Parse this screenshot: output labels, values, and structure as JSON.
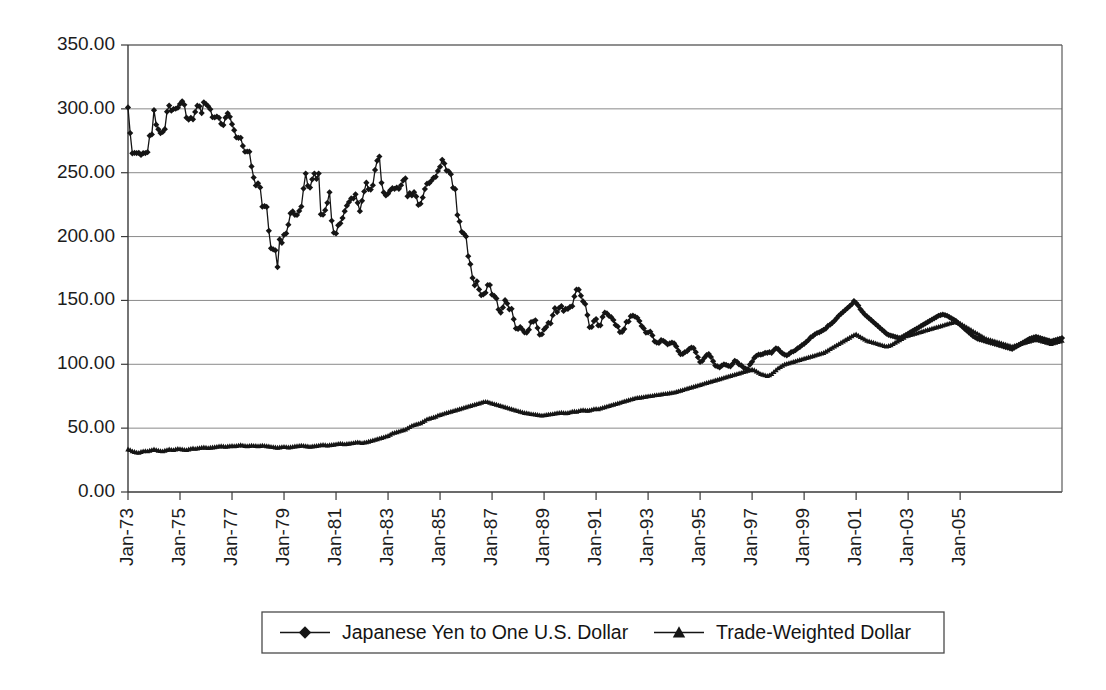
{
  "chart_data": {
    "type": "line",
    "title": "",
    "subtitle": "",
    "xlabel": "",
    "ylabel": "",
    "ylim": [
      0,
      350
    ],
    "ytick_step": 50,
    "ytick_labels": [
      "0.00",
      "50.00",
      "100.00",
      "150.00",
      "200.00",
      "250.00",
      "300.00",
      "350.00"
    ],
    "ytick_values": [
      0,
      50,
      100,
      150,
      200,
      250,
      300,
      350
    ],
    "xtick_labels": [
      "Jan-73",
      "Jan-75",
      "Jan-77",
      "Jan-79",
      "Jan-81",
      "Jan-83",
      "Jan-85",
      "Jan-87",
      "Jan-89",
      "Jan-91",
      "Jan-93",
      "Jan-95",
      "Jan-97",
      "Jan-99",
      "Jan-01",
      "Jan-03",
      "Jan-05"
    ],
    "xtick_rotation": -90,
    "x_start_label": "Jan-73",
    "x_end_label": "Dec-06",
    "x_points_per_tick": 24,
    "grid": "horizontal",
    "legend_position": "bottom",
    "colors": {
      "series": "#151515",
      "grid": "#8a8a8a",
      "axis": "#3a3a3a",
      "background": "#ffffff"
    },
    "series": [
      {
        "name": "Japanese Yen to One U.S. Dollar",
        "marker": "diamond",
        "values": [
          301.1,
          281.0,
          265.2,
          265.5,
          265.4,
          265.6,
          263.9,
          265.4,
          265.4,
          266.1,
          279.0,
          280.0,
          299.0,
          287.6,
          284.0,
          281.0,
          281.9,
          284.1,
          297.8,
          302.6,
          298.5,
          299.9,
          300.1,
          300.9,
          303.8,
          305.9,
          303.2,
          293.1,
          291.6,
          293.0,
          291.8,
          297.6,
          302.5,
          302.0,
          296.7,
          305.1,
          303.7,
          302.0,
          299.7,
          293.5,
          293.3,
          294.0,
          293.0,
          288.3,
          287.3,
          293.1,
          296.5,
          293.8,
          288.0,
          283.3,
          277.7,
          277.3,
          277.3,
          271.0,
          266.4,
          266.6,
          266.5,
          254.9,
          246.2,
          240.0,
          241.7,
          238.5,
          223.4,
          223.9,
          223.2,
          204.5,
          190.8,
          190.0,
          189.2,
          176.1,
          197.8,
          195.1,
          201.4,
          202.5,
          209.3,
          218.2,
          219.7,
          217.0,
          216.9,
          220.1,
          223.5,
          237.6,
          249.4,
          239.7,
          238.4,
          244.8,
          249.4,
          245.1,
          249.4,
          217.4,
          217.1,
          220.7,
          226.4,
          234.7,
          212.4,
          203.0,
          202.4,
          208.8,
          210.4,
          214.5,
          219.9,
          224.2,
          227.0,
          229.9,
          229.8,
          233.1,
          226.4,
          219.9,
          228.0,
          235.3,
          242.2,
          237.1,
          236.8,
          240.2,
          252.2,
          259.4,
          262.7,
          242.1,
          234.6,
          232.2,
          233.6,
          236.2,
          237.9,
          237.4,
          238.4,
          237.4,
          240.2,
          244.0,
          245.5,
          231.5,
          234.1,
          232.2,
          234.8,
          231.4,
          224.8,
          225.7,
          230.6,
          237.2,
          241.4,
          241.8,
          243.7,
          246.0,
          246.8,
          251.4,
          254.6,
          260.1,
          257.2,
          251.7,
          251.0,
          248.8,
          238.2,
          237.1,
          216.9,
          211.8,
          203.7,
          202.3,
          200.1,
          184.6,
          178.4,
          167.6,
          161.8,
          165.0,
          158.6,
          154.1,
          154.8,
          156.0,
          162.1,
          162.1,
          154.5,
          153.5,
          151.6,
          142.9,
          140.5,
          144.5,
          150.2,
          147.6,
          143.0,
          143.4,
          135.3,
          128.1,
          127.7,
          129.2,
          127.2,
          124.9,
          124.8,
          127.1,
          133.1,
          133.4,
          134.4,
          128.4,
          123.2,
          123.5,
          127.3,
          129.1,
          132.5,
          132.0,
          138.4,
          143.9,
          140.9,
          144.2,
          145.5,
          141.8,
          143.4,
          143.4,
          144.9,
          145.5,
          153.1,
          158.5,
          158.4,
          153.7,
          149.2,
          147.2,
          138.5,
          129.0,
          129.3,
          133.8,
          135.4,
          130.4,
          130.5,
          137.1,
          140.4,
          139.8,
          137.9,
          136.9,
          134.6,
          130.8,
          129.6,
          125.2,
          125.3,
          127.6,
          133.2,
          133.5,
          137.7,
          138.1,
          137.3,
          136.4,
          133.8,
          130.0,
          128.1,
          124.8,
          124.9,
          125.5,
          122.6,
          118.0,
          117.0,
          116.7,
          118.9,
          118.4,
          117.2,
          115.6,
          116.4,
          117.0,
          116.4,
          114.0,
          110.5,
          107.9,
          108.1,
          109.6,
          110.2,
          112.1,
          113.1,
          112.6,
          109.5,
          105.5,
          101.8,
          102.6,
          105.1,
          107.1,
          108.0,
          105.7,
          102.4,
          99.0,
          98.4,
          97.5,
          99.0,
          99.9,
          99.5,
          98.8,
          98.4,
          100.3,
          102.7,
          102.0,
          99.9,
          99.2,
          97.5,
          96.6,
          96.1,
          99.8,
          102.0,
          105.0,
          106.7,
          107.5,
          107.5,
          108.0,
          109.0,
          109.0,
          109.5,
          109.0,
          111.0,
          112.5,
          112.0,
          110.0,
          108.5,
          107.5,
          107.0,
          108.0,
          109.5,
          110.0,
          111.0,
          112.5,
          113.5,
          115.0,
          116.0,
          117.5,
          119.0,
          121.0,
          122.0,
          123.5,
          124.5,
          125.0,
          126.0,
          127.0,
          128.0,
          130.0,
          131.0,
          132.5,
          134.0,
          136.0,
          138.0,
          139.5,
          141.0,
          142.5,
          144.0,
          145.5,
          147.0,
          149.5,
          148.0,
          146.0,
          143.0,
          141.0,
          139.0,
          137.5,
          136.0,
          134.5,
          133.0,
          131.5,
          130.0,
          128.5,
          127.0,
          125.5,
          124.0,
          123.0,
          122.5,
          122.0,
          121.5,
          121.0,
          120.5,
          121.0,
          122.0,
          123.0,
          124.0,
          125.0,
          126.0,
          127.0,
          128.0,
          129.0,
          130.0,
          131.0,
          132.0,
          133.0,
          134.0,
          135.0,
          136.0,
          137.0,
          138.0,
          138.5,
          139.0,
          138.5,
          138.0,
          137.0,
          136.0,
          135.0,
          134.0,
          132.5,
          131.0,
          129.5,
          128.0,
          126.5,
          125.0,
          123.5,
          122.0,
          121.0,
          120.0,
          119.5,
          119.0,
          118.5,
          118.0,
          117.5,
          117.0,
          116.5,
          116.0,
          115.5,
          115.0,
          114.5,
          114.0,
          113.5,
          113.0,
          112.5,
          112.0,
          113.0,
          114.0,
          115.0,
          116.0,
          117.0,
          118.0,
          119.0,
          120.0,
          120.5,
          121.0,
          121.5,
          121.0,
          120.5,
          120.0,
          119.5,
          119.0,
          118.5,
          118.0,
          118.5,
          119.0,
          119.5,
          120.0,
          120.5
        ]
      },
      {
        "name": "Trade-Weighted Dollar",
        "marker": "triangle",
        "values": [
          33.5,
          33.0,
          32.0,
          31.5,
          31.0,
          30.8,
          31.5,
          32.0,
          32.2,
          32.0,
          32.5,
          33.0,
          33.5,
          33.0,
          32.5,
          32.2,
          32.0,
          32.5,
          33.0,
          33.5,
          33.2,
          33.0,
          33.5,
          34.0,
          33.8,
          33.5,
          33.2,
          33.0,
          33.5,
          34.0,
          34.2,
          34.0,
          34.2,
          34.5,
          34.8,
          35.0,
          34.8,
          34.5,
          34.8,
          35.0,
          35.2,
          35.5,
          35.8,
          36.0,
          35.8,
          35.5,
          35.8,
          36.0,
          36.2,
          36.0,
          36.2,
          36.5,
          36.8,
          36.5,
          36.2,
          36.0,
          36.2,
          36.5,
          36.3,
          36.2,
          36.0,
          36.2,
          36.5,
          36.3,
          36.0,
          35.8,
          35.5,
          35.3,
          35.0,
          34.8,
          35.0,
          35.3,
          35.5,
          35.3,
          35.0,
          35.2,
          35.5,
          35.8,
          36.0,
          36.2,
          36.5,
          36.3,
          36.0,
          35.8,
          35.5,
          35.8,
          36.0,
          36.2,
          36.5,
          36.8,
          37.0,
          36.8,
          36.5,
          36.8,
          37.0,
          37.2,
          37.5,
          37.8,
          38.0,
          37.8,
          37.5,
          37.8,
          38.0,
          38.2,
          38.5,
          38.8,
          39.0,
          38.8,
          38.5,
          38.8,
          39.0,
          39.5,
          40.0,
          40.5,
          41.0,
          41.5,
          42.0,
          42.5,
          43.0,
          43.5,
          44.0,
          45.0,
          46.0,
          46.5,
          47.0,
          47.5,
          48.0,
          48.5,
          49.0,
          50.0,
          51.0,
          52.0,
          52.5,
          53.0,
          53.5,
          54.0,
          55.0,
          56.0,
          57.0,
          57.5,
          58.0,
          58.5,
          59.0,
          60.0,
          60.5,
          61.0,
          61.5,
          62.0,
          62.5,
          63.0,
          63.5,
          64.0,
          64.5,
          65.0,
          65.5,
          66.0,
          66.5,
          67.0,
          67.5,
          68.0,
          68.5,
          69.0,
          69.5,
          70.0,
          70.5,
          70.8,
          70.5,
          70.0,
          69.5,
          69.0,
          68.5,
          68.0,
          67.5,
          67.0,
          66.5,
          66.0,
          65.5,
          65.0,
          64.5,
          64.0,
          63.5,
          63.0,
          62.5,
          62.0,
          61.8,
          61.5,
          61.2,
          61.0,
          60.8,
          60.5,
          60.2,
          60.0,
          60.2,
          60.5,
          60.8,
          61.0,
          61.2,
          61.5,
          61.8,
          62.0,
          62.2,
          62.0,
          61.8,
          62.0,
          62.5,
          63.0,
          63.2,
          63.0,
          63.5,
          64.0,
          64.2,
          64.0,
          63.8,
          64.0,
          64.5,
          65.0,
          65.2,
          65.0,
          65.5,
          66.0,
          66.5,
          67.0,
          67.5,
          68.0,
          68.5,
          69.0,
          69.5,
          70.0,
          70.5,
          71.0,
          71.5,
          72.0,
          72.5,
          73.0,
          73.5,
          73.8,
          74.0,
          74.2,
          74.5,
          74.8,
          75.0,
          75.2,
          75.5,
          75.8,
          76.0,
          76.2,
          76.5,
          76.8,
          77.0,
          77.2,
          77.5,
          77.8,
          78.0,
          78.5,
          79.0,
          79.5,
          80.0,
          80.5,
          81.0,
          81.5,
          82.0,
          82.5,
          83.0,
          83.5,
          84.0,
          84.5,
          85.0,
          85.5,
          86.0,
          86.5,
          87.0,
          87.5,
          88.0,
          88.5,
          89.0,
          89.5,
          90.0,
          90.5,
          91.0,
          91.5,
          92.0,
          92.5,
          93.0,
          93.5,
          94.0,
          94.5,
          95.0,
          95.5,
          96.0,
          95.5,
          94.5,
          93.5,
          92.5,
          92.0,
          91.5,
          91.0,
          91.5,
          92.5,
          94.0,
          95.5,
          97.0,
          98.0,
          99.0,
          100.0,
          100.5,
          101.0,
          101.5,
          102.0,
          102.5,
          103.0,
          103.5,
          104.0,
          104.5,
          105.0,
          105.5,
          106.0,
          106.5,
          107.0,
          107.5,
          108.0,
          108.5,
          109.0,
          110.0,
          111.0,
          112.0,
          113.0,
          114.0,
          115.0,
          116.0,
          117.0,
          118.0,
          119.0,
          120.0,
          121.0,
          122.0,
          123.0,
          123.5,
          122.5,
          121.5,
          120.5,
          119.5,
          118.5,
          118.0,
          117.5,
          117.0,
          116.5,
          116.0,
          115.5,
          115.0,
          114.5,
          114.0,
          114.5,
          115.0,
          116.0,
          117.0,
          118.0,
          119.0,
          120.0,
          121.0,
          122.0,
          122.5,
          123.0,
          123.5,
          124.0,
          124.5,
          125.0,
          125.5,
          126.0,
          126.5,
          127.0,
          127.5,
          128.0,
          128.5,
          129.0,
          129.5,
          130.0,
          130.5,
          131.0,
          131.5,
          132.0,
          132.5,
          133.0,
          133.0,
          132.5,
          132.0,
          131.0,
          130.0,
          129.0,
          128.0,
          127.0,
          126.0,
          125.0,
          124.0,
          123.0,
          122.0,
          121.0,
          120.0,
          119.5,
          119.0,
          118.5,
          118.0,
          117.5,
          117.0,
          116.5,
          116.0,
          115.5,
          115.0,
          114.5,
          114.0,
          114.5,
          115.0,
          115.5,
          116.0,
          116.5,
          117.0,
          117.5,
          118.0,
          118.5,
          119.0,
          119.5,
          119.0,
          118.5,
          118.0,
          117.5,
          117.0,
          116.5,
          116.0,
          116.5,
          117.0,
          117.5,
          118.0,
          118.5
        ]
      }
    ]
  },
  "legend": {
    "items": [
      {
        "label": "Japanese Yen to One U.S. Dollar",
        "marker": "diamond"
      },
      {
        "label": "Trade-Weighted Dollar",
        "marker": "triangle"
      }
    ]
  }
}
